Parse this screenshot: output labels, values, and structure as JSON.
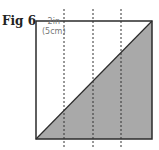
{
  "figure": {
    "label": "Fig 6",
    "dimension_line1": "2in",
    "dimension_line2": "(5cm)",
    "colors": {
      "outline": "#2b2b2b",
      "shade": "#a9a9a9",
      "dashed": "#333333",
      "label_text": "#777777"
    }
  }
}
